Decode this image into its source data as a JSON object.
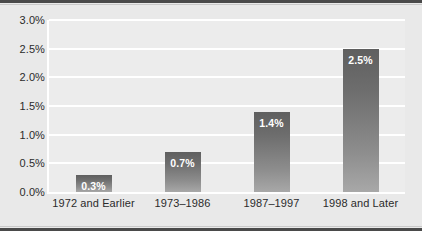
{
  "chart_data": {
    "type": "bar",
    "title": "",
    "xlabel": "",
    "ylabel": "",
    "categories": [
      "1972 and Earlier",
      "1973–1986",
      "1987–1997",
      "1998 and Later"
    ],
    "values": [
      0.3,
      0.7,
      1.4,
      2.5
    ],
    "value_labels": [
      "0.3%",
      "0.7%",
      "1.4%",
      "2.5%"
    ],
    "ylim": [
      0.0,
      3.0
    ],
    "ytick_values": [
      0.0,
      0.5,
      1.0,
      1.5,
      2.0,
      2.5,
      3.0
    ],
    "ytick_labels": [
      "0.0%",
      "0.5%",
      "1.0%",
      "1.5%",
      "2.0%",
      "2.5%",
      "3.0%"
    ],
    "grid": true,
    "grid_color": "#ffffff",
    "legend": null,
    "legend_position": "none",
    "bar_color_top": "#5f5f5f",
    "bar_color_bottom": "#a8a8a8",
    "plot_background": "#ececec",
    "figure_background": "#e9e9e9",
    "text_color": "#2b2b2b",
    "value_label_color": "#ffffff",
    "frame_rule_color": "#4a4a4a"
  }
}
